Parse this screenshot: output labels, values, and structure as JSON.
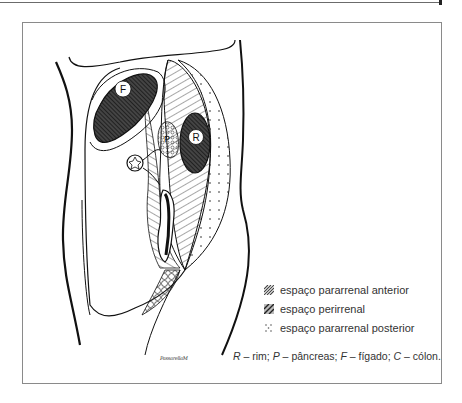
{
  "figure": {
    "organ_labels": {
      "liver": "F",
      "kidney": "R",
      "pancreas": "P"
    },
    "legend": [
      {
        "pattern": "anterior-hatch",
        "label": "espaço pararrenal anterior"
      },
      {
        "pattern": "perirenal-hatch",
        "label": "espaço perirrenal"
      },
      {
        "pattern": "dots",
        "label": "espaço pararrenal posterior"
      }
    ],
    "caption": {
      "r_key": "R",
      "r_text": " – rim; ",
      "p_key": "P",
      "p_text": " – pâncreas; ",
      "f_key": "F",
      "f_text": " – fígado; ",
      "c_key": "C",
      "c_text": " – cólon."
    },
    "signature": "PassarellaM"
  }
}
